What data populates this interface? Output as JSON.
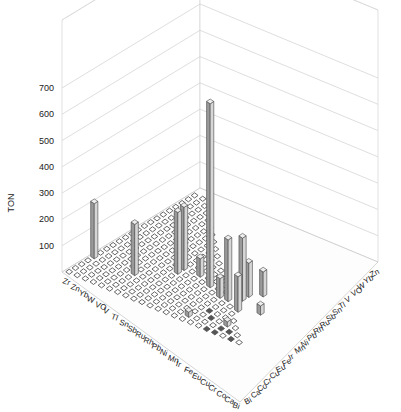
{
  "chart_data": {
    "type": "bar3d",
    "title": "",
    "zlabel": "TON",
    "zlim": [
      0,
      700
    ],
    "zticks": [
      100,
      200,
      300,
      400,
      500,
      600,
      700
    ],
    "grid": true,
    "left_axis_labels": [
      "Zr",
      "Zn",
      "Yb",
      "W",
      "VO",
      "V",
      "Tl",
      "Sn",
      "Sb",
      "Ru",
      "Rh",
      "Pb",
      "Ni",
      "Mn",
      "Ir",
      "Fe",
      "Eu",
      "Cu",
      "Cr",
      "Co",
      "Ca",
      "Bi"
    ],
    "right_axis_labels": [
      "Bi",
      "Ca",
      "Co",
      "Cr",
      "Cu",
      "Eu",
      "Fe",
      "Ir",
      "Mn",
      "Ni",
      "Pb",
      "Rh",
      "Ru",
      "Sb",
      "Sn",
      "Tl",
      "V",
      "VO",
      "W",
      "Yb",
      "Zn"
    ],
    "bars": [
      {
        "left": "Zr",
        "right": "Cu",
        "value": 210
      },
      {
        "left": "V",
        "right": "Cu",
        "value": 195
      },
      {
        "left": "Sb",
        "right": "Ir",
        "value": 235
      },
      {
        "left": "Sb",
        "right": "Mn",
        "value": 240
      },
      {
        "left": "Rh",
        "right": "Mn",
        "value": 70
      },
      {
        "left": "Ni",
        "right": "Ir",
        "value": 700
      },
      {
        "left": "Ir",
        "right": "Fe",
        "value": 75
      },
      {
        "left": "Eu",
        "right": "Ir",
        "value": 240
      },
      {
        "left": "Eu",
        "right": "Mn",
        "value": 130
      },
      {
        "left": "Cu",
        "right": "Ni",
        "value": 95
      },
      {
        "left": "Fe",
        "right": "Fe",
        "value": 235
      },
      {
        "left": "Cu",
        "right": "Eu",
        "value": 135
      },
      {
        "left": "Co",
        "right": "Fe",
        "value": 35
      },
      {
        "left": "Cr",
        "right": "Co",
        "value": 20
      },
      {
        "left": "Ir",
        "right": "Ca",
        "value": 20
      }
    ],
    "dark_markers": [
      {
        "left": "Cu",
        "right": "Bi"
      },
      {
        "left": "Cr",
        "right": "Ca"
      },
      {
        "left": "Co",
        "right": "Ca"
      },
      {
        "left": "Eu",
        "right": "Co"
      },
      {
        "left": "Fe",
        "right": "Cr"
      },
      {
        "left": "Ca",
        "right": "Bi"
      },
      {
        "left": "Cr",
        "right": "Bi"
      }
    ]
  }
}
